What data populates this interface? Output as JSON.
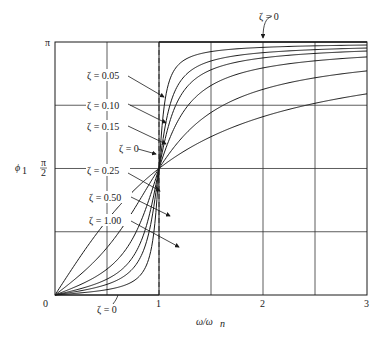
{
  "chart_data": {
    "type": "line",
    "title": "",
    "xlabel": "ω/ω_n",
    "ylabel": "ϕ₁",
    "xlim": [
      0,
      3
    ],
    "ylim": [
      0,
      3.14159
    ],
    "grid": true,
    "x_ticks": [
      {
        "value": 0,
        "label": "0"
      },
      {
        "value": 1,
        "label": "1"
      },
      {
        "value": 2,
        "label": "2"
      },
      {
        "value": 3,
        "label": "3"
      }
    ],
    "y_ticks": [
      {
        "value": 0,
        "label": ""
      },
      {
        "value": 1.5708,
        "label": "π/2"
      },
      {
        "value": 3.14159,
        "label": "π"
      }
    ],
    "grid_x": [
      0.5,
      1.5,
      2.5
    ],
    "grid_y": [
      0.7854,
      1.5708,
      2.3562
    ],
    "dashed_x": 1,
    "series": [
      {
        "name": "ζ = 0",
        "zeta": 0,
        "values_note": "step: 0 for ω/ωn<1, π for ω/ωn>1"
      },
      {
        "name": "ζ = 0.05",
        "zeta": 0.05
      },
      {
        "name": "ζ = 0.10",
        "zeta": 0.1
      },
      {
        "name": "ζ = 0.15",
        "zeta": 0.15
      },
      {
        "name": "ζ = 0.25",
        "zeta": 0.25
      },
      {
        "name": "ζ = 0.50",
        "zeta": 0.5
      },
      {
        "name": "ζ = 1.00",
        "zeta": 1.0
      }
    ],
    "annotations": [
      {
        "text": "ζ = 0",
        "pos": "top",
        "points_to": "upper boundary line at π"
      },
      {
        "text": "ζ = 0.05",
        "points_to": "ζ=0.05 curve"
      },
      {
        "text": "ζ = 0.10",
        "points_to": "ζ=0.10 curve"
      },
      {
        "text": "ζ = 0.15",
        "points_to": "ζ=0.15 curve"
      },
      {
        "text": "ζ = 0",
        "points_to": "vertical step at ω/ωn = 1"
      },
      {
        "text": "ζ = 0.25",
        "points_to": "ζ=0.25 curve"
      },
      {
        "text": "ζ = 0.50",
        "points_to": "ζ=0.50 curve"
      },
      {
        "text": "ζ = 1.00",
        "points_to": "ζ=1.00 curve"
      },
      {
        "text": "ζ = 0",
        "pos": "bottom",
        "points_to": "lower boundary line at 0"
      }
    ]
  },
  "labels": {
    "pi": "π",
    "half_pi_num": "π",
    "half_pi_den": "2",
    "phi": "ϕ",
    "phi_sub": "1",
    "x_0": "0",
    "x_1": "1",
    "x_2": "2",
    "x_3": "3",
    "xaxis": "ω/ω",
    "xaxis_sub": "n",
    "z_top": "ζ = 0",
    "z005": "ζ = 0.05",
    "z010": "ζ = 0.10",
    "z015": "ζ = 0.15",
    "z0mid": "ζ = 0",
    "z025": "ζ = 0.25",
    "z050": "ζ = 0.50",
    "z100": "ζ = 1.00",
    "z_bottom": "ζ = 0"
  }
}
